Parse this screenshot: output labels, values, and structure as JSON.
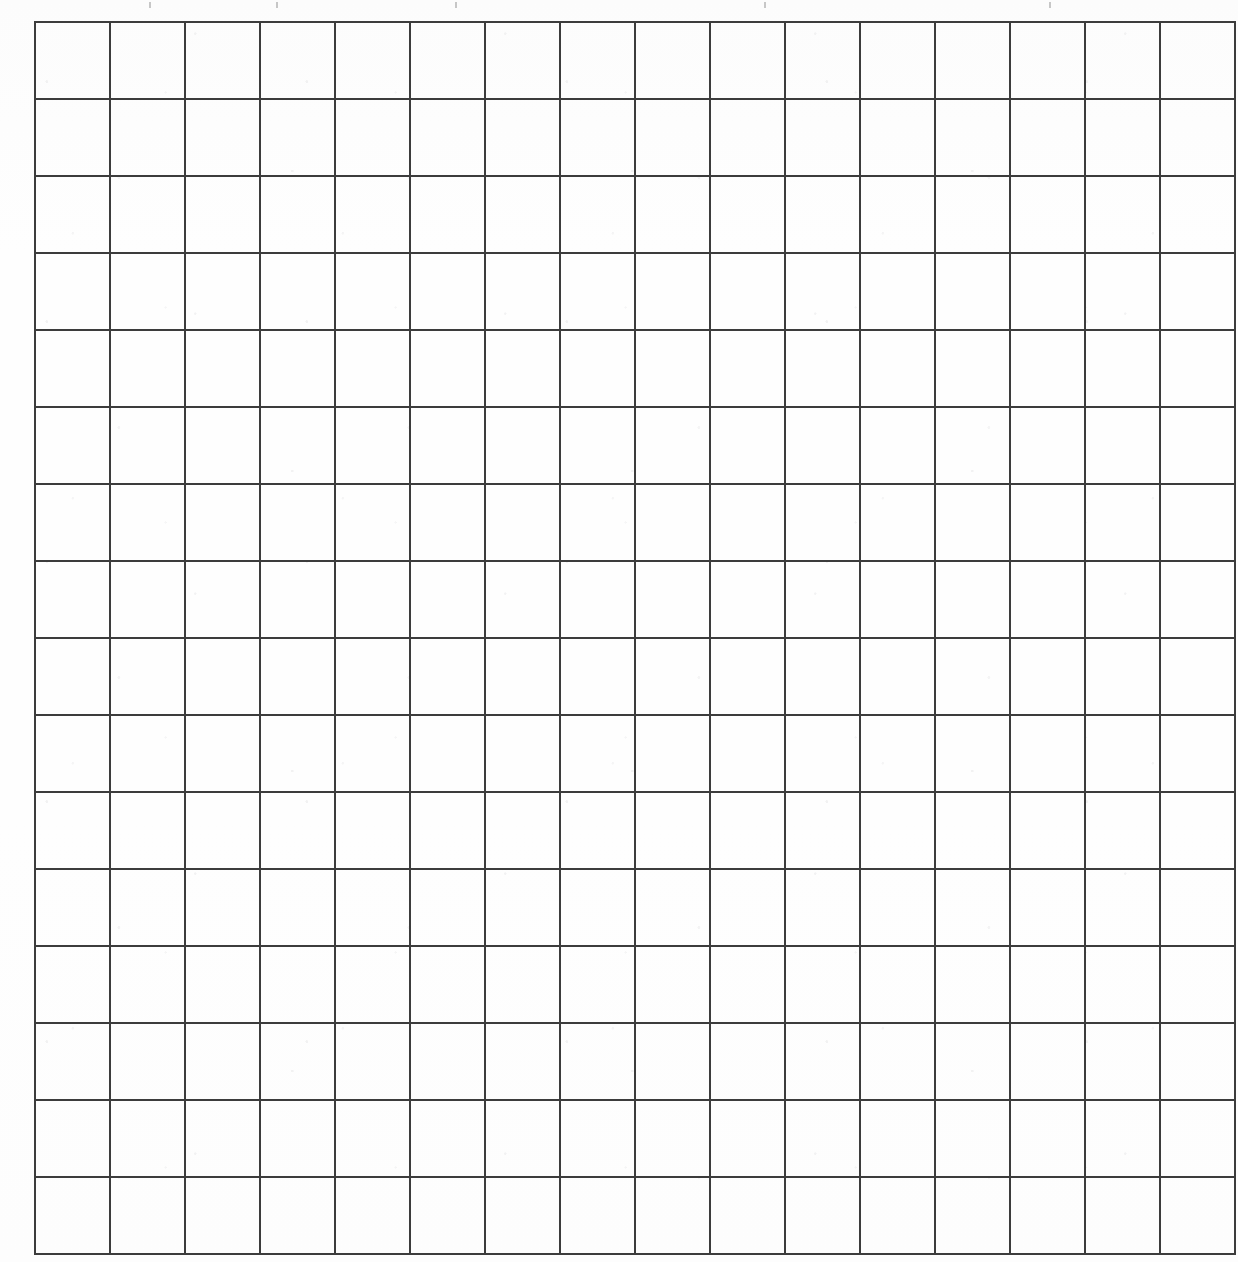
{
  "document": {
    "title": "Blank Grid Worksheet",
    "type": "scanned-blank-grid",
    "medium": "white paper scan",
    "visible_text": "",
    "note": "No printed labels, numbers, headings or legends are visible anywhere in the image."
  },
  "grid": {
    "columns": 16,
    "rows": 16,
    "cell_width_px": 73,
    "cell_height_px": 75,
    "left_px": 34,
    "top_px": 21,
    "right_px": 1202,
    "bottom_px": 1221,
    "line_color": "#3c3c3c",
    "line_width_px": 2,
    "cell_fill": "#ffffff",
    "cells_filled": 0,
    "column_headers": [
      "",
      "",
      "",
      "",
      "",
      "",
      "",
      "",
      "",
      "",
      "",
      "",
      "",
      "",
      "",
      ""
    ],
    "row_labels": [
      "",
      "",
      "",
      "",
      "",
      "",
      "",
      "",
      "",
      "",
      "",
      "",
      "",
      "",
      "",
      ""
    ],
    "cell_values": [
      [
        "",
        "",
        "",
        "",
        "",
        "",
        "",
        "",
        "",
        "",
        "",
        "",
        "",
        "",
        "",
        ""
      ],
      [
        "",
        "",
        "",
        "",
        "",
        "",
        "",
        "",
        "",
        "",
        "",
        "",
        "",
        "",
        "",
        ""
      ],
      [
        "",
        "",
        "",
        "",
        "",
        "",
        "",
        "",
        "",
        "",
        "",
        "",
        "",
        "",
        "",
        ""
      ],
      [
        "",
        "",
        "",
        "",
        "",
        "",
        "",
        "",
        "",
        "",
        "",
        "",
        "",
        "",
        "",
        ""
      ],
      [
        "",
        "",
        "",
        "",
        "",
        "",
        "",
        "",
        "",
        "",
        "",
        "",
        "",
        "",
        "",
        ""
      ],
      [
        "",
        "",
        "",
        "",
        "",
        "",
        "",
        "",
        "",
        "",
        "",
        "",
        "",
        "",
        "",
        ""
      ],
      [
        "",
        "",
        "",
        "",
        "",
        "",
        "",
        "",
        "",
        "",
        "",
        "",
        "",
        "",
        "",
        ""
      ],
      [
        "",
        "",
        "",
        "",
        "",
        "",
        "",
        "",
        "",
        "",
        "",
        "",
        "",
        "",
        "",
        ""
      ],
      [
        "",
        "",
        "",
        "",
        "",
        "",
        "",
        "",
        "",
        "",
        "",
        "",
        "",
        "",
        "",
        ""
      ],
      [
        "",
        "",
        "",
        "",
        "",
        "",
        "",
        "",
        "",
        "",
        "",
        "",
        "",
        "",
        "",
        ""
      ],
      [
        "",
        "",
        "",
        "",
        "",
        "",
        "",
        "",
        "",
        "",
        "",
        "",
        "",
        "",
        "",
        ""
      ],
      [
        "",
        "",
        "",
        "",
        "",
        "",
        "",
        "",
        "",
        "",
        "",
        "",
        "",
        "",
        "",
        ""
      ],
      [
        "",
        "",
        "",
        "",
        "",
        "",
        "",
        "",
        "",
        "",
        "",
        "",
        "",
        "",
        "",
        ""
      ],
      [
        "",
        "",
        "",
        "",
        "",
        "",
        "",
        "",
        "",
        "",
        "",
        "",
        "",
        "",
        "",
        ""
      ],
      [
        "",
        "",
        "",
        "",
        "",
        "",
        "",
        "",
        "",
        "",
        "",
        "",
        "",
        "",
        "",
        ""
      ],
      [
        "",
        "",
        "",
        "",
        "",
        "",
        "",
        "",
        "",
        "",
        "",
        "",
        "",
        "",
        "",
        ""
      ]
    ]
  },
  "artifacts": {
    "top_edge_ticks_x_px": [
      149,
      276,
      455,
      764,
      1049
    ],
    "description": "faint grey specks clipped at the top border of the scan"
  },
  "colors": {
    "page_background": "#ffffff",
    "paper_tone": "#fefefe",
    "grid_line": "#3c3c3c",
    "artifact_grey": "#9b9b9b"
  }
}
